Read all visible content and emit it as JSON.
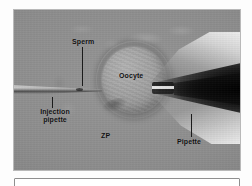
{
  "figure": {
    "kind": "light-micrograph",
    "background_color": "#8b8b8b",
    "labels": {
      "sperm": "Sperm",
      "injection_pipette": "Injection\npipette",
      "injection_pipette_line1": "Injection",
      "injection_pipette_line2": "pipette",
      "oocyte": "Oocyte",
      "zona_pellucida": "ZP",
      "holding_pipette": "Pipette"
    }
  },
  "caption": {
    "text": ""
  }
}
